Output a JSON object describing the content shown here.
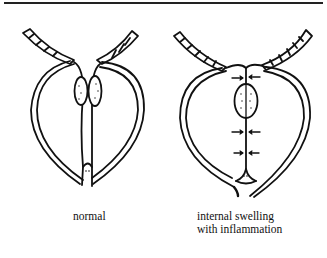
{
  "figure": {
    "panels": [
      {
        "id": "normal",
        "caption_lines": [
          "normal"
        ]
      },
      {
        "id": "inflamed",
        "caption_lines": [
          "internal swelling",
          "with inflammation"
        ],
        "arrow_pairs": 3
      }
    ],
    "colors": {
      "ink": "#111111",
      "background": "#ffffff"
    }
  }
}
